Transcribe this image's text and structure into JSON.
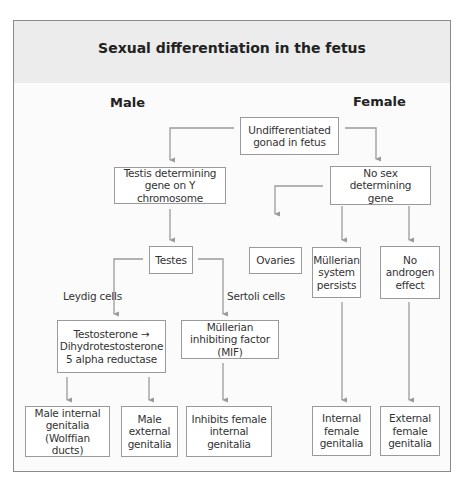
{
  "diagram": {
    "title": "Sexual differentiation in the fetus",
    "columns": {
      "male": "Male",
      "female": "Female"
    },
    "colors": {
      "header_bg": "#ececec",
      "box_border": "#9a9a9a",
      "arrow": "#9a9a9a",
      "frame_border": "#8a8a8a"
    },
    "nodes": {
      "undifferentiated": "Undifferentiated gonad in fetus",
      "testis_gene": "Testis determining gene on Y chromosome",
      "no_sex_gene": "No sex determining gene",
      "testes": "Testes",
      "ovaries": "Ovaries",
      "mullerian_persists": "Müllerian system persists",
      "no_androgen": "No androgen effect",
      "testosterone": "Testosterone → Dihydrotestosterone 5 alpha reductase",
      "mif": "Müllerian inhibiting factor (MIF)",
      "male_internal": "Male internal genitalia (Wolffian ducts)",
      "male_external": "Male external genitalia",
      "inhibits_female": "Inhibits female internal genitalia",
      "internal_female": "Internal female genitalia",
      "external_female": "External female genitalia"
    },
    "edge_labels": {
      "leydig": "Leydig cells",
      "sertoli": "Sertoli cells"
    },
    "edges": [
      [
        "undifferentiated",
        "testis_gene"
      ],
      [
        "undifferentiated",
        "no_sex_gene"
      ],
      [
        "testis_gene",
        "testes"
      ],
      [
        "no_sex_gene",
        "ovaries"
      ],
      [
        "no_sex_gene",
        "mullerian_persists"
      ],
      [
        "no_sex_gene",
        "no_androgen"
      ],
      [
        "testes",
        "testosterone",
        "Leydig cells"
      ],
      [
        "testes",
        "mif",
        "Sertoli cells"
      ],
      [
        "testosterone",
        "male_internal"
      ],
      [
        "testosterone",
        "male_external"
      ],
      [
        "mif",
        "inhibits_female"
      ],
      [
        "mullerian_persists",
        "internal_female"
      ],
      [
        "no_androgen",
        "external_female"
      ]
    ]
  }
}
